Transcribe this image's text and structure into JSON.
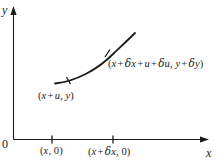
{
  "figure": {
    "background_color": "#ffffff",
    "stroke_color": "#1a1a1a",
    "axes": {
      "y_label": "y",
      "x_label": "x",
      "origin_label": "0"
    },
    "curve": {
      "shape": "concave-up increasing arc",
      "marks": [
        "tick-mark-left",
        "tick-mark-right"
      ]
    },
    "labels": {
      "lower_point": {
        "open": "(",
        "var1": "x",
        "plus1": "+",
        "var2": "u",
        "comma": ", ",
        "var3": "y",
        "close": ")"
      },
      "upper_point": {
        "open": "(",
        "var1": "x",
        "plus1": "+",
        "delta1": "δ",
        "var2": "x",
        "plus2": "+",
        "var3": "u",
        "plus3": "+",
        "delta2": "δ",
        "var4": "u",
        "comma": ", ",
        "var5": "y",
        "plus4": "+",
        "delta3": "δ",
        "var6": "y",
        "close": ")"
      },
      "x_tick_1": {
        "open": "(",
        "var1": "x",
        "comma": ", ",
        "zero": "0",
        "close": ")"
      },
      "x_tick_2": {
        "open": "(",
        "var1": "x",
        "plus1": "+",
        "delta1": "δ",
        "var2": "x",
        "comma": ", ",
        "zero": "0",
        "close": ")"
      }
    }
  }
}
